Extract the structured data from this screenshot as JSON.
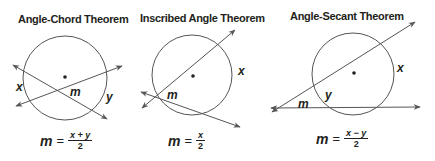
{
  "panels": [
    {
      "title": "Angle-Chord Theorem",
      "labels": {
        "x": "x",
        "y": "y",
        "m": "m"
      },
      "formula": {
        "lhs": "m",
        "eq": "=",
        "numerator": "x + y",
        "denominator": "2"
      }
    },
    {
      "title": "Inscribed Angle Theorem",
      "labels": {
        "x": "x",
        "m": "m"
      },
      "formula": {
        "lhs": "m",
        "eq": "=",
        "numerator": "x",
        "denominator": "2"
      }
    },
    {
      "title": "Angle-Secant Theorem",
      "labels": {
        "x": "x",
        "y": "y",
        "m": "m"
      },
      "formula": {
        "lhs": "m",
        "eq": "=",
        "numerator": "x − y",
        "denominator": "2"
      }
    }
  ],
  "colors": {
    "stroke": "#231f20",
    "circle": "#555555"
  }
}
